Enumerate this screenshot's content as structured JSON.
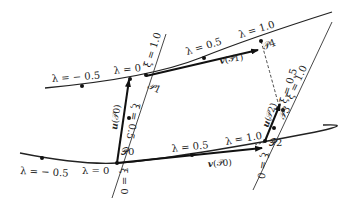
{
  "diagram": {
    "title": "",
    "labels": {
      "top_lambda_m05": "λ = − 0.5",
      "top_lambda_0": "λ = 0",
      "top_lambda_05": "λ = 0.5",
      "top_lambda_10": "λ = 1.0",
      "bot_lambda_m05": "λ = − 0.5",
      "bot_lambda_0": "λ = 0",
      "bot_lambda_05": "λ = 0.5",
      "bot_lambda_10": "λ = 1.0",
      "left_xi_0": "ξ = 0",
      "left_xi_05": "ξ = 0.5",
      "left_xi_10": "ξ = 1.0",
      "right_xi_0": "ξ = 0",
      "right_xi_05": "ξ = 0.5",
      "right_xi_10": "ξ = 1.0"
    },
    "points": {
      "P0": "𝒫0",
      "P1": "𝒫1",
      "P2": "𝒫2",
      "P3": "𝒫3",
      "P4": "𝒫4"
    },
    "vectors": {
      "u_P0": {
        "sym": "u",
        "arg": "(𝒫0)"
      },
      "v_P0": {
        "sym": "v",
        "arg": "(𝒫0)"
      },
      "v_P1": {
        "sym": "v",
        "arg": "(𝒫1)"
      },
      "u_P2": {
        "sym": "u",
        "arg": "(𝒫2)"
      }
    }
  }
}
